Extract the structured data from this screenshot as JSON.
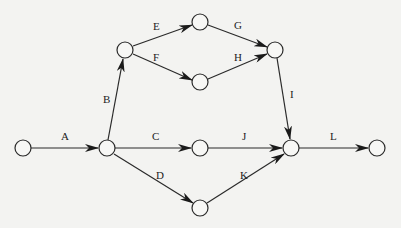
{
  "diagram": {
    "type": "activity-on-arrow network",
    "colors": {
      "background": "#f3f3f1",
      "stroke": "#2a2a2a",
      "text": "#222222"
    },
    "nodes": [
      {
        "id": "n1",
        "x": 23,
        "y": 148
      },
      {
        "id": "n2",
        "x": 107,
        "y": 148
      },
      {
        "id": "n3",
        "x": 125,
        "y": 50
      },
      {
        "id": "n4",
        "x": 200,
        "y": 22
      },
      {
        "id": "n5",
        "x": 200,
        "y": 82
      },
      {
        "id": "n6",
        "x": 275,
        "y": 50
      },
      {
        "id": "n7",
        "x": 200,
        "y": 148
      },
      {
        "id": "n8",
        "x": 200,
        "y": 208
      },
      {
        "id": "n9",
        "x": 291,
        "y": 148
      },
      {
        "id": "n10",
        "x": 377,
        "y": 148
      }
    ],
    "edges": [
      {
        "label": "A",
        "from": "n1",
        "to": "n2"
      },
      {
        "label": "B",
        "from": "n2",
        "to": "n3"
      },
      {
        "label": "C",
        "from": "n2",
        "to": "n7"
      },
      {
        "label": "D",
        "from": "n2",
        "to": "n8"
      },
      {
        "label": "E",
        "from": "n3",
        "to": "n4"
      },
      {
        "label": "F",
        "from": "n3",
        "to": "n5"
      },
      {
        "label": "G",
        "from": "n4",
        "to": "n6"
      },
      {
        "label": "H",
        "from": "n5",
        "to": "n6"
      },
      {
        "label": "I",
        "from": "n6",
        "to": "n9"
      },
      {
        "label": "J",
        "from": "n7",
        "to": "n9"
      },
      {
        "label": "K",
        "from": "n8",
        "to": "n9"
      },
      {
        "label": "L",
        "from": "n9",
        "to": "n10"
      }
    ]
  }
}
